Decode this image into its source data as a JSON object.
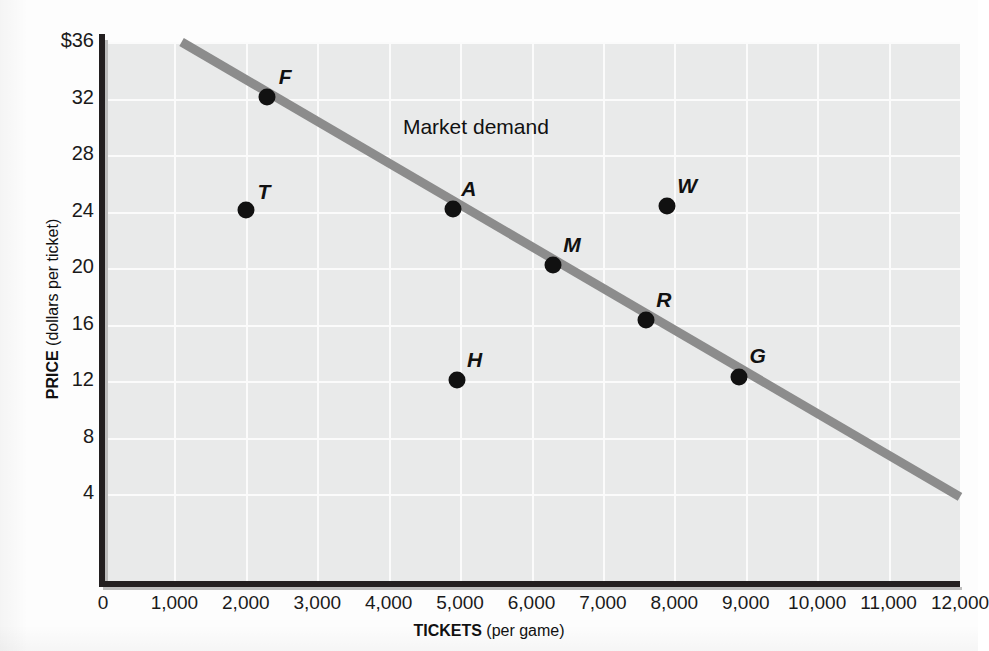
{
  "chart_data": {
    "type": "scatter",
    "title": "",
    "xlabel_bold": "TICKETS",
    "xlabel_rest": " (per game)",
    "ylabel_bold": "PRICE",
    "ylabel_rest": " (dollars per ticket)",
    "xlim": [
      0,
      12000
    ],
    "ylim": [
      0,
      36
    ],
    "grid": true,
    "legend_position": "inline-annotation",
    "annotations": [
      {
        "text": "Market demand",
        "x": 4200,
        "y": 30
      }
    ],
    "xticks": [
      "0",
      "1,000",
      "2,000",
      "3,000",
      "4,000",
      "5,000",
      "6,000",
      "7,000",
      "8,000",
      "9,000",
      "10,000",
      "11,000",
      "12,000"
    ],
    "xtick_values": [
      0,
      1000,
      2000,
      3000,
      4000,
      5000,
      6000,
      7000,
      8000,
      9000,
      10000,
      11000,
      12000
    ],
    "yticks": [
      "4",
      "8",
      "12",
      "16",
      "20",
      "24",
      "28",
      "32",
      "$36"
    ],
    "ytick_values": [
      4,
      8,
      12,
      16,
      20,
      24,
      28,
      32,
      36
    ],
    "series": [
      {
        "name": "Market demand",
        "type": "line",
        "color": "#8c8c8c",
        "x": [
          1100,
          12000
        ],
        "y": [
          36,
          3.8
        ]
      },
      {
        "name": "Points",
        "type": "scatter",
        "color": "#111111",
        "points": [
          {
            "label": "F",
            "x": 2300,
            "y": 32.1,
            "on_line": true,
            "label_dx": 18,
            "label_dy": -20
          },
          {
            "label": "T",
            "x": 2000,
            "y": 24.1,
            "on_line": false,
            "label_dx": 18,
            "label_dy": -18
          },
          {
            "label": "A",
            "x": 4900,
            "y": 24.2,
            "on_line": true,
            "label_dx": 16,
            "label_dy": -20
          },
          {
            "label": "M",
            "x": 6300,
            "y": 20.2,
            "on_line": true,
            "label_dx": 19,
            "label_dy": -20
          },
          {
            "label": "W",
            "x": 7900,
            "y": 24.4,
            "on_line": false,
            "label_dx": 20,
            "label_dy": -20
          },
          {
            "label": "R",
            "x": 7600,
            "y": 16.3,
            "on_line": true,
            "label_dx": 18,
            "label_dy": -20
          },
          {
            "label": "H",
            "x": 4950,
            "y": 12.1,
            "on_line": false,
            "label_dx": 18,
            "label_dy": -20
          },
          {
            "label": "G",
            "x": 8900,
            "y": 12.3,
            "on_line": true,
            "label_dx": 19,
            "label_dy": -21
          }
        ]
      }
    ],
    "colors": {
      "plot_background": "#e9eaea",
      "gridline": "#fbfbfb",
      "axis": "#231f20",
      "demand_line": "#8c8c8c",
      "point": "#111111",
      "text": "#111111"
    }
  }
}
